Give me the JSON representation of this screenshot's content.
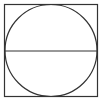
{
  "diagram": {
    "shapes": [
      {
        "type": "square",
        "x": 4.5,
        "y": 4.5,
        "width": 93,
        "height": 92
      },
      {
        "type": "circle",
        "cx": 51,
        "cy": 50.5,
        "r": 46
      },
      {
        "type": "line",
        "x1": 4.5,
        "y1": 51,
        "x2": 97.5,
        "y2": 51
      }
    ],
    "stroke_color": "#333333",
    "background": "#ffffff"
  }
}
